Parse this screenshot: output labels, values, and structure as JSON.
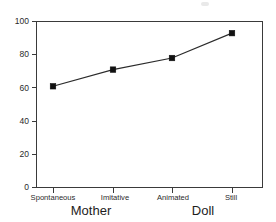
{
  "chart_data": {
    "type": "line",
    "title": "",
    "xlabel": "",
    "ylabel": "",
    "categories": [
      "Spontaneous",
      "Imitative",
      "Animated",
      "Still"
    ],
    "values": [
      61,
      71,
      78,
      93
    ],
    "series": [
      {
        "name": "",
        "values": [
          61,
          71,
          78,
          93
        ]
      }
    ],
    "ylim": [
      0,
      100
    ],
    "yticks": [
      0,
      20,
      40,
      60,
      80,
      100
    ],
    "ytick_labels": [
      "0",
      "20",
      "40",
      "60",
      "80",
      "100"
    ],
    "grid": false,
    "legend": false,
    "legend_position": "none",
    "marker": "square",
    "line_color": "#2b2b2b",
    "marker_color": "#111111",
    "axis_color": "#3a3a3a",
    "background": "#ffffff",
    "groups": [
      {
        "label": "Mother",
        "categories": [
          "Spontaneous",
          "Imitative"
        ]
      },
      {
        "label": "Doll",
        "categories": [
          "Animated",
          "Still"
        ]
      }
    ]
  },
  "axes": {
    "y": {
      "tick_labels": [
        "100",
        "80",
        "60",
        "40",
        "20",
        "0"
      ]
    },
    "x": {
      "tick_labels": [
        "Spontaneous",
        "Imitative",
        "Animated",
        "Still"
      ],
      "group_labels": [
        "Mother",
        "Doll"
      ]
    }
  }
}
